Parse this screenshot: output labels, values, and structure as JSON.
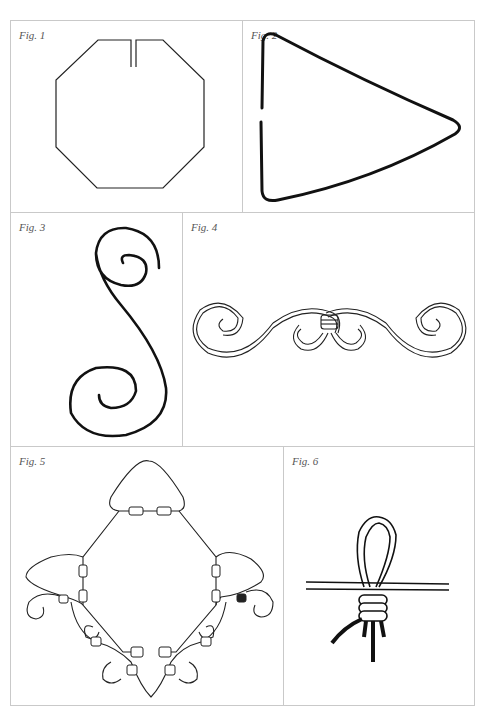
{
  "figures": [
    {
      "id": 1,
      "label": "Fig. 1",
      "subject": "octagon wire frame with gap"
    },
    {
      "id": 2,
      "label": "Fig. 2",
      "subject": "triangle wire frame with gap"
    },
    {
      "id": 3,
      "label": "Fig. 3",
      "subject": "S-scroll wire"
    },
    {
      "id": 4,
      "label": "Fig. 4",
      "subject": "double scroll ornament with binding"
    },
    {
      "id": 5,
      "label": "Fig. 5",
      "subject": "assembled wire ornament with triangles, scrolls and bindings"
    },
    {
      "id": 6,
      "label": "Fig. 6",
      "subject": "wire loop wrapped knot"
    }
  ],
  "colors": {
    "line": "#111111",
    "border": "#c9c9c9",
    "label": "#555555"
  }
}
